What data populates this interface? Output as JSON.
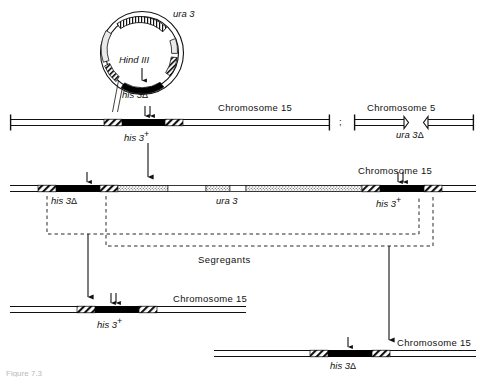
{
  "figure": {
    "caption": "Figure 7.3",
    "width": 486,
    "height": 377,
    "colors": {
      "ink": "#111111",
      "black_segment": "#000000",
      "hatch": "#111111",
      "stipple": "#777777",
      "paper": "#ffffff"
    }
  },
  "plasmid": {
    "name": "integrating-plasmid",
    "labels": {
      "ura3": "ura 3",
      "hind3": "Hind III",
      "his3delta": "his 3",
      "his3delta_symbol": "Δ"
    }
  },
  "row1": {
    "chromosome15_label": "Chromosome 15",
    "chromosome5_label": "Chromosome 5",
    "his3plus_label": "his 3",
    "his3plus_sup": "+",
    "ura3delta_label": "ura 3",
    "ura3delta_symbol": "Δ",
    "separator": ";"
  },
  "row2": {
    "chromosome15_label": "Chromosome 15",
    "his3delta_label": "his 3",
    "his3delta_symbol": "Δ",
    "ura3_label": "ura 3",
    "his3plus_label": "his 3",
    "his3plus_sup": "+"
  },
  "segregants": {
    "label": "Segregants"
  },
  "row3": {
    "chromosome15_label": "Chromosome 15",
    "his3plus_label": "his 3",
    "his3plus_sup": "+"
  },
  "row4": {
    "chromosome15_label": "Chromosome 15",
    "his3delta_label": "his 3",
    "his3delta_symbol": "Δ"
  }
}
